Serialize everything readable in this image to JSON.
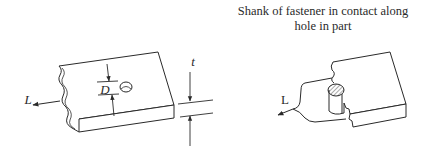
{
  "caption": {
    "line1": "Shank of fastener in contact along",
    "line2": "hole in part"
  },
  "left_figure": {
    "load_label": "L",
    "diameter_label": "D",
    "thickness_label": "t"
  },
  "right_figure": {
    "load_label": "L"
  },
  "colors": {
    "line": "#2a2a2a",
    "background": "#ffffff"
  }
}
